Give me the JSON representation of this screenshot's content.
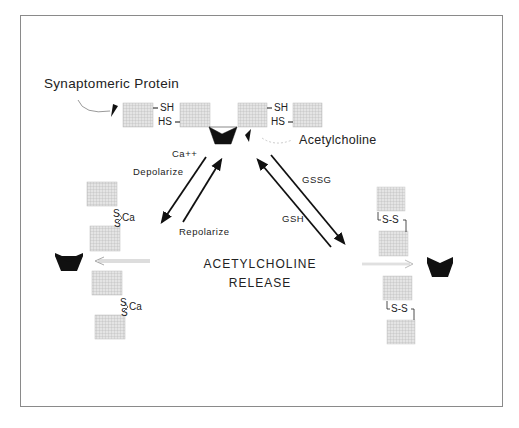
{
  "diagram": {
    "labels": {
      "synaptomeric_protein": "Synaptomeric Protein",
      "acetylcholine": "Acetylcholine",
      "ca": "Ca++",
      "depolarize": "Depolarize",
      "repolarize": "Repolarize",
      "gssg": "GSSG",
      "gsh": "GSH",
      "center_line1": "ACETYLCHOLINE",
      "center_line2": "RELEASE"
    },
    "bond_labels": {
      "top_sh_1": "SH",
      "top_hs_1": "HS",
      "top_sh_2": "SH",
      "top_hs_2": "HS",
      "left_s_top_1": "S",
      "left_ca_1": "Ca",
      "left_s_bot_1": "S",
      "left_s_top_2": "S",
      "left_ca_2": "Ca",
      "left_s_bot_2": "S",
      "right_ss_1": "S-S",
      "right_ss_2": "S-S"
    },
    "states": [
      {
        "name": "reduced",
        "bond": "SH HS",
        "position": "top"
      },
      {
        "name": "calcium-bridged",
        "bond": "S-Ca-S",
        "position": "left"
      },
      {
        "name": "oxidized",
        "bond": "S-S",
        "position": "right"
      }
    ],
    "transitions": [
      {
        "from": "reduced",
        "to": "calcium-bridged",
        "label": "Ca++ / Depolarize"
      },
      {
        "from": "calcium-bridged",
        "to": "reduced",
        "label": "Repolarize"
      },
      {
        "from": "reduced",
        "to": "oxidized",
        "label": "GSSG"
      },
      {
        "from": "oxidized",
        "to": "reduced",
        "label": "GSH"
      }
    ],
    "colors": {
      "box_fill": "#d9d9d9",
      "box_grid": "#b8b8b8",
      "ink": "#111111",
      "frame": "#8a8a8a"
    }
  }
}
